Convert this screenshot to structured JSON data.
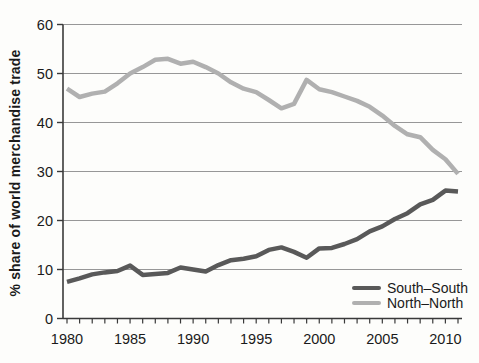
{
  "figure": {
    "background": "#fdfdfb",
    "axis_color": "#3a3a3a",
    "grid_color": "#979797",
    "text_color": "#1a1a1a"
  },
  "chart_data": {
    "type": "line",
    "title": "",
    "xlabel": "",
    "ylabel": "% share of world merchandise trade",
    "ylim": [
      0,
      60
    ],
    "ytick_interval": 10,
    "yticks": [
      0,
      10,
      20,
      30,
      40,
      50,
      60
    ],
    "xticks_labeled": [
      1980,
      1985,
      1990,
      1995,
      2000,
      2005,
      2010
    ],
    "xtick_minor_interval": 1,
    "grid": "horizontal",
    "legend_position": "inside-bottom-right",
    "x": [
      1980,
      1981,
      1982,
      1983,
      1984,
      1985,
      1986,
      1987,
      1988,
      1989,
      1990,
      1991,
      1992,
      1993,
      1994,
      1995,
      1996,
      1997,
      1998,
      1999,
      2000,
      2001,
      2002,
      2003,
      2004,
      2005,
      2006,
      2007,
      2008,
      2009,
      2010,
      2011
    ],
    "series": [
      {
        "name": "South–South",
        "color": "#595959",
        "values": [
          7.5,
          8.2,
          9.0,
          9.4,
          9.7,
          10.8,
          8.9,
          9.1,
          9.3,
          10.4,
          10.0,
          9.6,
          10.9,
          11.9,
          12.2,
          12.7,
          14.0,
          14.5,
          13.6,
          12.4,
          14.3,
          14.4,
          15.2,
          16.2,
          17.8,
          18.8,
          20.3,
          21.5,
          23.3,
          24.2,
          26.1,
          25.9
        ]
      },
      {
        "name": "North–North",
        "color": "#b0b0b0",
        "values": [
          46.9,
          45.2,
          45.9,
          46.3,
          48.0,
          50.0,
          51.3,
          52.8,
          53.0,
          52.0,
          52.4,
          51.3,
          50.0,
          48.2,
          46.9,
          46.2,
          44.6,
          42.9,
          43.8,
          48.7,
          46.8,
          46.2,
          45.3,
          44.4,
          43.2,
          41.4,
          39.3,
          37.6,
          37.0,
          34.4,
          32.5,
          29.5
        ]
      }
    ]
  }
}
